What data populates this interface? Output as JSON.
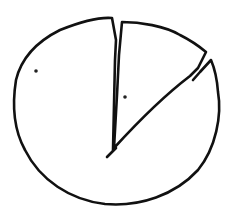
{
  "sketch": {
    "description": "Hand-drawn pie chart with one exploded slice",
    "stroke_color": "#111111",
    "background_color": "#ffffff",
    "slices": [
      {
        "name": "main-slice",
        "label_marker": "dot",
        "marker_position": [
          36,
          71
        ],
        "approx_share_percent": 82
      },
      {
        "name": "exploded-slice",
        "label_marker": "dot",
        "marker_position": [
          125,
          97
        ],
        "approx_share_percent": 18
      }
    ]
  }
}
